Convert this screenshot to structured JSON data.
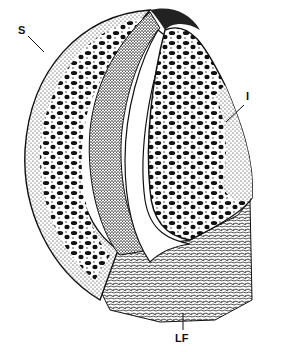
{
  "figure": {
    "type": "anatomical-illustration",
    "labels": [
      {
        "id": "S",
        "text": "S",
        "x": 18,
        "y": 26
      },
      {
        "id": "I",
        "text": "I",
        "x": 248,
        "y": 97
      },
      {
        "id": "LF",
        "text": "LF",
        "x": 174,
        "y": 333
      }
    ],
    "colors": {
      "ink": "#111111",
      "paper": "#ffffff"
    }
  }
}
